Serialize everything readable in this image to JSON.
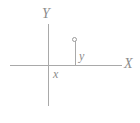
{
  "figure": {
    "title": "",
    "background_color": "#ffffff",
    "line_color": "#a9a9a9",
    "text_color": "#8c8c8c"
  },
  "axes": {
    "x_axis_label": "X",
    "y_axis_label": "Y"
  },
  "annotations": {
    "horizontal_distance_label": "x",
    "vertical_distance_label": "y"
  },
  "point": {
    "marker": "open-circle",
    "label": ""
  },
  "chart_data": {
    "type": "scatter",
    "title": "",
    "xlabel": "X",
    "ylabel": "Y",
    "grid": false,
    "legend": false,
    "x": [
      1
    ],
    "y": [
      1
    ],
    "annotations": [
      "x",
      "y"
    ]
  }
}
